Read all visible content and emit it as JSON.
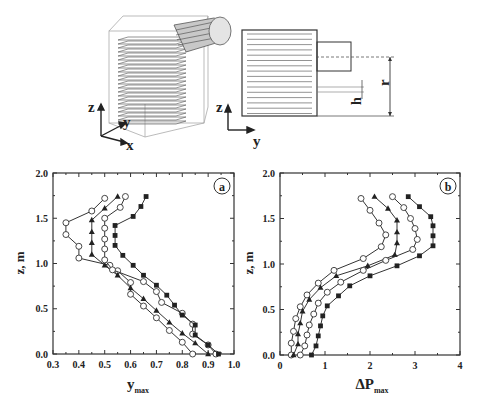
{
  "schematic": {
    "left_axes": {
      "z": "z",
      "y": "y",
      "x": "x"
    },
    "right_axes": {
      "z": "z",
      "y": "y"
    },
    "dim_labels": {
      "h": "h",
      "r": "r"
    }
  },
  "chart_data": [
    {
      "type": "line",
      "panel_label": "a",
      "title": "",
      "xlabel": "y",
      "xlabel_sub": "max",
      "ylabel": "z, m",
      "xlim": [
        0.3,
        1.0
      ],
      "ylim": [
        0.0,
        2.0
      ],
      "xticks": [
        "0.3",
        "0.4",
        "0.5",
        "0.6",
        "0.7",
        "0.8",
        "0.9",
        "1.0"
      ],
      "yticks": [
        "0.0",
        "0.5",
        "1.0",
        "1.5",
        "2.0"
      ],
      "grid": false,
      "series": [
        {
          "name": "series-1",
          "marker": "open-circle",
          "x": [
            0.5,
            0.45,
            0.35,
            0.35,
            0.4,
            0.4,
            0.52,
            0.55,
            0.6,
            0.6,
            0.65,
            0.7,
            0.75,
            0.8,
            0.84
          ],
          "y": [
            1.72,
            1.58,
            1.45,
            1.32,
            1.19,
            1.06,
            0.98,
            0.92,
            0.79,
            0.66,
            0.53,
            0.4,
            0.26,
            0.13,
            0.0
          ]
        },
        {
          "name": "series-2",
          "marker": "filled-triangle",
          "x": [
            0.55,
            0.5,
            0.45,
            0.45,
            0.45,
            0.45,
            0.5,
            0.55,
            0.6,
            0.65,
            0.7,
            0.75,
            0.8,
            0.85,
            0.9
          ],
          "y": [
            1.74,
            1.61,
            1.48,
            1.35,
            1.23,
            1.1,
            0.98,
            0.87,
            0.73,
            0.61,
            0.48,
            0.35,
            0.23,
            0.12,
            0.0
          ]
        },
        {
          "name": "series-3",
          "marker": "open-circle",
          "x": [
            0.58,
            0.56,
            0.5,
            0.5,
            0.5,
            0.5,
            0.5,
            0.53,
            0.65,
            0.7,
            0.72,
            0.8,
            0.84,
            0.84,
            0.9,
            0.93
          ],
          "y": [
            1.74,
            1.62,
            1.5,
            1.39,
            1.27,
            1.16,
            1.04,
            0.93,
            0.8,
            0.69,
            0.57,
            0.45,
            0.33,
            0.22,
            0.1,
            0.0
          ]
        },
        {
          "name": "series-4",
          "marker": "filled-square",
          "x": [
            0.66,
            0.64,
            0.61,
            0.54,
            0.54,
            0.54,
            0.57,
            0.61,
            0.65,
            0.7,
            0.74,
            0.77,
            0.8,
            0.85,
            0.85,
            0.9,
            0.94
          ],
          "y": [
            1.74,
            1.63,
            1.52,
            1.42,
            1.31,
            1.2,
            1.09,
            0.98,
            0.87,
            0.76,
            0.65,
            0.54,
            0.43,
            0.32,
            0.21,
            0.1,
            0.0
          ]
        }
      ]
    },
    {
      "type": "line",
      "panel_label": "b",
      "title": "",
      "xlabel": "ΔP",
      "xlabel_sub": "max",
      "ylabel": "z, m",
      "xlim": [
        0,
        4
      ],
      "ylim": [
        0.0,
        2.0
      ],
      "xticks": [
        "0",
        "1",
        "2",
        "3",
        "4"
      ],
      "yticks": [
        "0.0",
        "0.5",
        "1.0",
        "1.5",
        "2.0"
      ],
      "grid": false,
      "series": [
        {
          "name": "series-1",
          "marker": "open-circle",
          "x": [
            1.8,
            2.0,
            2.2,
            2.35,
            2.25,
            1.85,
            1.2,
            0.85,
            0.6,
            0.45,
            0.35,
            0.3,
            0.25,
            0.25
          ],
          "y": [
            1.72,
            1.59,
            1.45,
            1.32,
            1.19,
            1.06,
            0.93,
            0.79,
            0.66,
            0.53,
            0.4,
            0.26,
            0.13,
            0.0
          ]
        },
        {
          "name": "series-2",
          "marker": "filled-triangle",
          "x": [
            2.1,
            2.4,
            2.6,
            2.6,
            2.6,
            2.55,
            1.95,
            1.25,
            0.9,
            0.65,
            0.5,
            0.45,
            0.4,
            0.4,
            0.3
          ],
          "y": [
            1.74,
            1.61,
            1.48,
            1.35,
            1.23,
            1.1,
            0.98,
            0.87,
            0.74,
            0.61,
            0.48,
            0.35,
            0.23,
            0.12,
            0.0
          ]
        },
        {
          "name": "series-3",
          "marker": "open-circle",
          "x": [
            2.5,
            2.75,
            2.9,
            3.0,
            3.05,
            2.95,
            2.35,
            1.85,
            1.35,
            1.05,
            0.85,
            0.75,
            0.65,
            0.6,
            0.55,
            0.45
          ],
          "y": [
            1.74,
            1.62,
            1.5,
            1.39,
            1.27,
            1.16,
            1.04,
            0.93,
            0.8,
            0.69,
            0.57,
            0.45,
            0.33,
            0.22,
            0.1,
            0.0
          ]
        },
        {
          "name": "series-4",
          "marker": "filled-square",
          "x": [
            2.85,
            3.1,
            3.35,
            3.4,
            3.4,
            3.4,
            3.1,
            2.6,
            2.0,
            1.55,
            1.3,
            1.05,
            0.95,
            0.9,
            0.85,
            0.8,
            0.7
          ],
          "y": [
            1.74,
            1.63,
            1.52,
            1.42,
            1.31,
            1.2,
            1.09,
            0.98,
            0.87,
            0.76,
            0.65,
            0.54,
            0.43,
            0.32,
            0.21,
            0.1,
            0.0
          ]
        }
      ]
    }
  ]
}
